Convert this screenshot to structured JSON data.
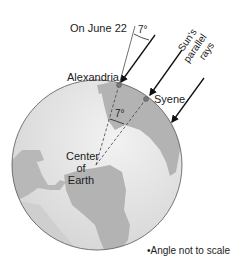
{
  "figure": {
    "date_label": "On June 22",
    "top_angle": "7°",
    "center_angle": "7°",
    "rays_label_line1": "Sun's",
    "rays_label_line2": "parallel",
    "rays_label_line3": "rays",
    "city_alexandria": "Alexandria",
    "city_syene": "Syene",
    "center_line1": "Center",
    "center_line2": "of",
    "center_line3": "Earth",
    "footnote": "•Angle not to scale"
  },
  "colors": {
    "ocean": "#e6e6e6",
    "land": "#b3b3b3",
    "outline": "#555555",
    "ray": "#111111",
    "city_dot": "#777777"
  }
}
